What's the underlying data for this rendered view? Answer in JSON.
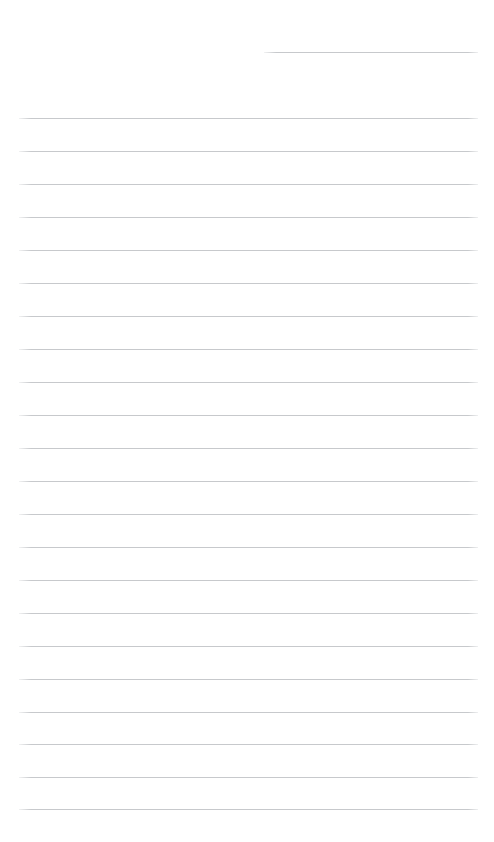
{
  "page": {
    "kind": "ruled-notepad-page",
    "width": 494,
    "height": 842,
    "background_color": "#ffffff",
    "text_content": ""
  },
  "rules": {
    "line_color": "#c7c9cc",
    "line_thickness_px": 1,
    "line_spacing_px": 33,
    "full_line_left_px": 19,
    "full_line_right_px": 478,
    "count_total": 23,
    "count_full_width": 22,
    "count_partial": 1,
    "lines": [
      {
        "id": "rule-01",
        "y": 52,
        "left": 264,
        "right": 478,
        "partial": true
      },
      {
        "id": "rule-02",
        "y": 118,
        "left": 19,
        "right": 478,
        "partial": false
      },
      {
        "id": "rule-03",
        "y": 151,
        "left": 19,
        "right": 478,
        "partial": false
      },
      {
        "id": "rule-04",
        "y": 184,
        "left": 19,
        "right": 478,
        "partial": false
      },
      {
        "id": "rule-05",
        "y": 217,
        "left": 19,
        "right": 478,
        "partial": false
      },
      {
        "id": "rule-06",
        "y": 250,
        "left": 19,
        "right": 478,
        "partial": false
      },
      {
        "id": "rule-07",
        "y": 283,
        "left": 19,
        "right": 478,
        "partial": false
      },
      {
        "id": "rule-08",
        "y": 316,
        "left": 19,
        "right": 478,
        "partial": false
      },
      {
        "id": "rule-09",
        "y": 349,
        "left": 19,
        "right": 478,
        "partial": false
      },
      {
        "id": "rule-10",
        "y": 382,
        "left": 19,
        "right": 478,
        "partial": false
      },
      {
        "id": "rule-11",
        "y": 415,
        "left": 19,
        "right": 478,
        "partial": false
      },
      {
        "id": "rule-12",
        "y": 448,
        "left": 19,
        "right": 478,
        "partial": false
      },
      {
        "id": "rule-13",
        "y": 481,
        "left": 19,
        "right": 478,
        "partial": false
      },
      {
        "id": "rule-14",
        "y": 514,
        "left": 19,
        "right": 478,
        "partial": false
      },
      {
        "id": "rule-15",
        "y": 547,
        "left": 19,
        "right": 478,
        "partial": false
      },
      {
        "id": "rule-16",
        "y": 580,
        "left": 19,
        "right": 478,
        "partial": false
      },
      {
        "id": "rule-17",
        "y": 613,
        "left": 19,
        "right": 478,
        "partial": false
      },
      {
        "id": "rule-18",
        "y": 646,
        "left": 19,
        "right": 478,
        "partial": false
      },
      {
        "id": "rule-19",
        "y": 679,
        "left": 19,
        "right": 478,
        "partial": false
      },
      {
        "id": "rule-20",
        "y": 712,
        "left": 19,
        "right": 478,
        "partial": false
      },
      {
        "id": "rule-21",
        "y": 744,
        "left": 19,
        "right": 478,
        "partial": false
      },
      {
        "id": "rule-22",
        "y": 777,
        "left": 19,
        "right": 478,
        "partial": false
      },
      {
        "id": "rule-23",
        "y": 809,
        "left": 19,
        "right": 478,
        "partial": false
      }
    ]
  }
}
